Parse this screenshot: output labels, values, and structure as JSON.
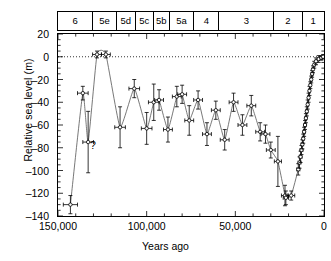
{
  "chart_data": {
    "type": "line",
    "title": "",
    "xlabel": "Years ago",
    "ylabel": "Relative sea level (m)",
    "xlim": [
      150000,
      0
    ],
    "ylim": [
      -140,
      20
    ],
    "x_reversed": true,
    "grid": false,
    "legend": "none",
    "xticks": [
      150000,
      100000,
      50000,
      0
    ],
    "xtick_labels": [
      "150,000",
      "100,000",
      "50,000",
      "0"
    ],
    "xtick_minor_step": 10000,
    "yticks": [
      20,
      0,
      -20,
      -40,
      -60,
      -80,
      -100,
      -120,
      -140
    ],
    "ytick_labels": [
      "20",
      "0",
      "-20",
      "-40",
      "-60",
      "-80",
      "-100",
      "-120",
      "-140"
    ],
    "ytick_minor_step": 5,
    "zero_line": 0,
    "zero_line_style": "dotted",
    "annotations": [
      {
        "text": "?",
        "x": 132000,
        "y": -73
      }
    ],
    "marker": "open-circle-with-error-bars",
    "series": [
      {
        "name": "Relative sea level",
        "points": [
          {
            "x": 143000,
            "y": -130,
            "xerr": 4000,
            "yerr": 8
          },
          {
            "x": 136000,
            "y": -32,
            "xerr": 3000,
            "yerr": 6
          },
          {
            "x": 133000,
            "y": -75,
            "xerr": 3000,
            "yerr": 27
          },
          {
            "x": 128000,
            "y": 2,
            "xerr": 2500,
            "yerr": 3
          },
          {
            "x": 123000,
            "y": 2,
            "xerr": 2500,
            "yerr": 3
          },
          {
            "x": 115000,
            "y": -62,
            "xerr": 3000,
            "yerr": 18
          },
          {
            "x": 107000,
            "y": -28,
            "xerr": 3000,
            "yerr": 8
          },
          {
            "x": 100000,
            "y": -63,
            "xerr": 3000,
            "yerr": 14
          },
          {
            "x": 96000,
            "y": -40,
            "xerr": 3000,
            "yerr": 16
          },
          {
            "x": 93000,
            "y": -38,
            "xerr": 2500,
            "yerr": 9
          },
          {
            "x": 88000,
            "y": -64,
            "xerr": 2500,
            "yerr": 11
          },
          {
            "x": 83000,
            "y": -35,
            "xerr": 2500,
            "yerr": 9
          },
          {
            "x": 80000,
            "y": -33,
            "xerr": 2500,
            "yerr": 8
          },
          {
            "x": 76000,
            "y": -56,
            "xerr": 2500,
            "yerr": 13
          },
          {
            "x": 71000,
            "y": -38,
            "xerr": 2500,
            "yerr": 8
          },
          {
            "x": 66000,
            "y": -68,
            "xerr": 2500,
            "yerr": 10
          },
          {
            "x": 61000,
            "y": -47,
            "xerr": 2500,
            "yerr": 8
          },
          {
            "x": 56000,
            "y": -73,
            "xerr": 2500,
            "yerr": 9
          },
          {
            "x": 51000,
            "y": -40,
            "xerr": 2500,
            "yerr": 8
          },
          {
            "x": 46000,
            "y": -60,
            "xerr": 2500,
            "yerr": 9
          },
          {
            "x": 41000,
            "y": -43,
            "xerr": 2500,
            "yerr": 9
          },
          {
            "x": 36000,
            "y": -66,
            "xerr": 2500,
            "yerr": 8
          },
          {
            "x": 33000,
            "y": -68,
            "xerr": 2500,
            "yerr": 8
          },
          {
            "x": 30000,
            "y": -82,
            "xerr": 2500,
            "yerr": 7
          },
          {
            "x": 26000,
            "y": -92,
            "xerr": 2000,
            "yerr": 22
          },
          {
            "x": 22000,
            "y": -122,
            "xerr": 2000,
            "yerr": 9
          },
          {
            "x": 21500,
            "y": -124,
            "xerr": 1500,
            "yerr": 6
          },
          {
            "x": 18500,
            "y": -122,
            "xerr": 2000,
            "yerr": 4
          },
          {
            "x": 14500,
            "y": -99,
            "xerr": 900,
            "yerr": 5
          },
          {
            "x": 13800,
            "y": -93,
            "xerr": 800,
            "yerr": 5
          },
          {
            "x": 13200,
            "y": -88,
            "xerr": 800,
            "yerr": 5
          },
          {
            "x": 12700,
            "y": -82,
            "xerr": 800,
            "yerr": 4
          },
          {
            "x": 12200,
            "y": -77,
            "xerr": 700,
            "yerr": 4
          },
          {
            "x": 11700,
            "y": -72,
            "xerr": 700,
            "yerr": 4
          },
          {
            "x": 11200,
            "y": -66,
            "xerr": 700,
            "yerr": 4
          },
          {
            "x": 10700,
            "y": -60,
            "xerr": 700,
            "yerr": 4
          },
          {
            "x": 10200,
            "y": -54,
            "xerr": 700,
            "yerr": 4
          },
          {
            "x": 9700,
            "y": -48,
            "xerr": 700,
            "yerr": 4
          },
          {
            "x": 9200,
            "y": -42,
            "xerr": 600,
            "yerr": 4
          },
          {
            "x": 8700,
            "y": -36,
            "xerr": 600,
            "yerr": 4
          },
          {
            "x": 8200,
            "y": -30,
            "xerr": 600,
            "yerr": 4
          },
          {
            "x": 7700,
            "y": -25,
            "xerr": 600,
            "yerr": 3
          },
          {
            "x": 7200,
            "y": -20,
            "xerr": 600,
            "yerr": 3
          },
          {
            "x": 6700,
            "y": -15,
            "xerr": 600,
            "yerr": 3
          },
          {
            "x": 6200,
            "y": -11,
            "xerr": 500,
            "yerr": 3
          },
          {
            "x": 5500,
            "y": -7,
            "xerr": 500,
            "yerr": 3
          },
          {
            "x": 4500,
            "y": -4,
            "xerr": 500,
            "yerr": 3
          },
          {
            "x": 3000,
            "y": -2,
            "xerr": 500,
            "yerr": 3
          },
          {
            "x": 1500,
            "y": -1,
            "xerr": 500,
            "yerr": 2
          },
          {
            "x": 500,
            "y": 0,
            "xerr": 400,
            "yerr": 2
          }
        ]
      }
    ]
  },
  "stage_axis": {
    "name": "marine-isotope-stages",
    "stages": [
      {
        "label": "6",
        "start": 150000,
        "end": 130000
      },
      {
        "label": "5e",
        "start": 130000,
        "end": 117000
      },
      {
        "label": "5d",
        "start": 117000,
        "end": 106000
      },
      {
        "label": "5c",
        "start": 106000,
        "end": 96000
      },
      {
        "label": "5b",
        "start": 96000,
        "end": 87000
      },
      {
        "label": "5a",
        "start": 87000,
        "end": 73000
      },
      {
        "label": "4",
        "start": 73000,
        "end": 59000
      },
      {
        "label": "3",
        "start": 59000,
        "end": 28000
      },
      {
        "label": "2",
        "start": 28000,
        "end": 12000
      },
      {
        "label": "1",
        "start": 12000,
        "end": 0
      }
    ]
  }
}
